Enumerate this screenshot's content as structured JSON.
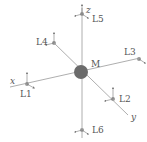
{
  "diagram": {
    "center_label": "M",
    "axes": {
      "x": "x",
      "y": "y",
      "z": "z"
    },
    "nodes": [
      {
        "id": "L1",
        "label": "L1"
      },
      {
        "id": "L2",
        "label": "L2"
      },
      {
        "id": "L3",
        "label": "L3"
      },
      {
        "id": "L4",
        "label": "L4"
      },
      {
        "id": "L5",
        "label": "L5"
      },
      {
        "id": "L6",
        "label": "L6"
      }
    ],
    "colors": {
      "line": "#999999",
      "center": "#6b6b6b",
      "node": "#9a9a9a",
      "text": "#555555"
    }
  }
}
